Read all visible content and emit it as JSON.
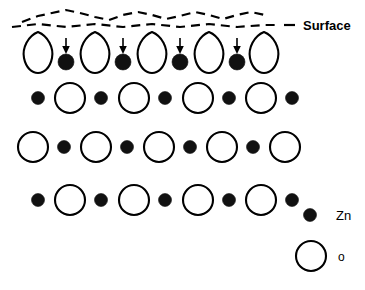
{
  "figure": {
    "title": "",
    "colors": {
      "zn_fill": "#111111",
      "o_fill": "#ffffff",
      "outline": "#000000",
      "background": "#ffffff"
    }
  },
  "surface": {
    "label": "Surface",
    "leader_dash": "–",
    "dashed_line_count": 2
  },
  "legend": {
    "items": [
      {
        "symbol": "zn-dot",
        "label": "Zn"
      },
      {
        "symbol": "o-circle",
        "label": "o"
      }
    ]
  },
  "lattice": {
    "rows": [
      {
        "name": "surface-row",
        "index": 1,
        "y": 50,
        "note": "relaxed surface layer: teardrop O with Zn displaced downward",
        "items": [
          {
            "type": "o-teardrop",
            "x": 38
          },
          {
            "type": "zn-arrow",
            "x": 66
          },
          {
            "type": "o-teardrop",
            "x": 95
          },
          {
            "type": "zn-arrow",
            "x": 123
          },
          {
            "type": "o-teardrop",
            "x": 152
          },
          {
            "type": "zn-arrow",
            "x": 180
          },
          {
            "type": "o-teardrop",
            "x": 209
          },
          {
            "type": "zn-arrow",
            "x": 237
          },
          {
            "type": "o-teardrop",
            "x": 264
          }
        ]
      },
      {
        "name": "bulk-row-1",
        "index": 2,
        "y": 98,
        "items": [
          {
            "type": "zn",
            "x": 38
          },
          {
            "type": "o",
            "x": 70
          },
          {
            "type": "zn",
            "x": 101
          },
          {
            "type": "o",
            "x": 134
          },
          {
            "type": "zn",
            "x": 165
          },
          {
            "type": "o",
            "x": 198
          },
          {
            "type": "zn",
            "x": 229
          },
          {
            "type": "o",
            "x": 261
          },
          {
            "type": "zn",
            "x": 292
          }
        ]
      },
      {
        "name": "bulk-row-2",
        "index": 3,
        "y": 147,
        "items": [
          {
            "type": "o",
            "x": 33
          },
          {
            "type": "zn",
            "x": 64
          },
          {
            "type": "o",
            "x": 96
          },
          {
            "type": "zn",
            "x": 127
          },
          {
            "type": "o",
            "x": 159
          },
          {
            "type": "zn",
            "x": 190
          },
          {
            "type": "o",
            "x": 222
          },
          {
            "type": "zn",
            "x": 253
          },
          {
            "type": "o",
            "x": 285
          }
        ]
      },
      {
        "name": "bulk-row-3",
        "index": 4,
        "y": 200,
        "items": [
          {
            "type": "zn",
            "x": 38
          },
          {
            "type": "o",
            "x": 70
          },
          {
            "type": "zn",
            "x": 101
          },
          {
            "type": "o",
            "x": 134
          },
          {
            "type": "zn",
            "x": 165
          },
          {
            "type": "o",
            "x": 198
          },
          {
            "type": "zn",
            "x": 229
          },
          {
            "type": "o",
            "x": 261
          },
          {
            "type": "zn",
            "x": 292
          }
        ]
      }
    ]
  },
  "geometry": {
    "o_radius": 15,
    "zn_radius": 6.5,
    "legend_o_radius": 15,
    "legend_zn_radius": 6.5
  }
}
